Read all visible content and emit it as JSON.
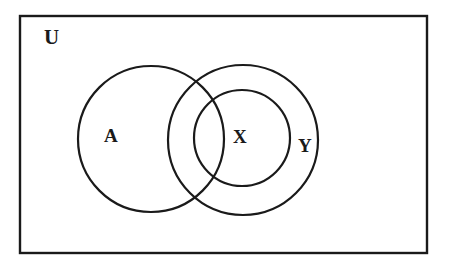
{
  "diagram": {
    "type": "venn-diagram",
    "background_color": "#ffffff",
    "stroke_color": "#1a1a1a",
    "universe": {
      "label": "U",
      "shape": "rectangle",
      "x": 20,
      "y": 16,
      "width": 407,
      "height": 237,
      "stroke_width": 2
    },
    "circles": [
      {
        "label": "A",
        "name": "set-a",
        "cx": 151,
        "cy": 139,
        "r": 73,
        "stroke_width": 2.2
      },
      {
        "label": "Y",
        "name": "set-y",
        "cx": 243,
        "cy": 140,
        "r": 75,
        "stroke_width": 2.2
      },
      {
        "label": "X",
        "name": "set-x",
        "cx": 242,
        "cy": 138,
        "r": 48,
        "stroke_width": 2.2
      }
    ],
    "labels": [
      {
        "text": "U",
        "name": "universe-label",
        "x": 51,
        "y": 38
      },
      {
        "text": "A",
        "name": "set-a-label",
        "x": 111,
        "y": 136
      },
      {
        "text": "X",
        "name": "set-x-label",
        "x": 239,
        "y": 137
      },
      {
        "text": "Y",
        "name": "set-y-label",
        "x": 305,
        "y": 146
      }
    ],
    "relations": [
      "X is a subset of Y",
      "A overlaps X and Y",
      "A, X and Y are all inside U"
    ]
  }
}
